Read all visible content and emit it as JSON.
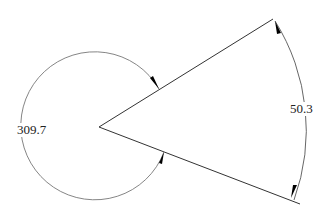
{
  "diagram": {
    "type": "angle-dimension",
    "vertex": [
      99,
      127
    ],
    "ray_upper_end": [
      273,
      19
    ],
    "ray_lower_end": [
      300,
      204
    ],
    "angles": [
      {
        "id": "interior",
        "value_label": "50.3",
        "arc_radius": 205
      },
      {
        "id": "reflex",
        "value_label": "309.7",
        "arc_radius": 74
      }
    ],
    "colors": {
      "line": "#333333",
      "arc": "#666666",
      "arrow": "#000000",
      "text": "#222222"
    }
  }
}
